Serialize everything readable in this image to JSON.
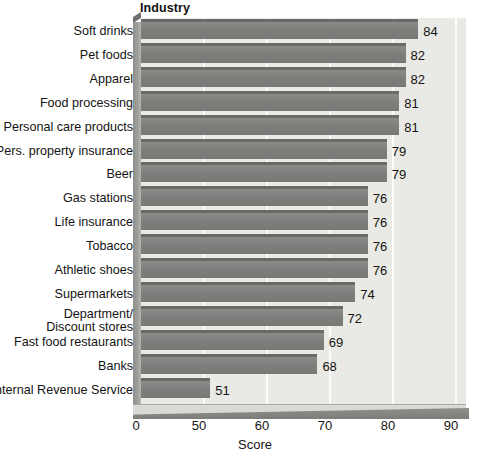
{
  "chart_data": {
    "type": "bar",
    "orientation": "horizontal",
    "title": "Industry",
    "xlabel": "Score",
    "ylabel": "",
    "grid": true,
    "legend": "none",
    "xlim": [
      0,
      90
    ],
    "xticks": [
      0,
      50,
      60,
      70,
      80,
      90
    ],
    "xtick_labels": [
      "0",
      "50",
      "60",
      "70",
      "80",
      "90"
    ],
    "axis_note": "broken axis: 0 to 50 compressed into one interval",
    "categories": [
      "Soft drinks",
      "Pet foods",
      "Apparel",
      "Food processing",
      "Personal care products",
      "Pers. property insurance",
      "Beer",
      "Gas stations",
      "Life insurance",
      "Tobacco",
      "Athletic shoes",
      "Supermarkets",
      "Department/ Discount stores",
      "Fast food restaurants",
      "Banks",
      "Internal Revenue Service"
    ],
    "category_lines": [
      [
        "Soft drinks"
      ],
      [
        "Pet foods"
      ],
      [
        "Apparel"
      ],
      [
        "Food processing"
      ],
      [
        "Personal care products"
      ],
      [
        "Pers. property insurance"
      ],
      [
        "Beer"
      ],
      [
        "Gas stations"
      ],
      [
        "Life insurance"
      ],
      [
        "Tobacco"
      ],
      [
        "Athletic shoes"
      ],
      [
        "Supermarkets"
      ],
      [
        "Department/",
        "Discount stores"
      ],
      [
        "Fast food restaurants"
      ],
      [
        "Banks"
      ],
      [
        "Internal Revenue Service"
      ]
    ],
    "values": [
      84,
      82,
      82,
      81,
      81,
      79,
      79,
      76,
      76,
      76,
      76,
      74,
      72,
      69,
      68,
      51
    ],
    "value_labels": [
      "84",
      "82",
      "82",
      "81",
      "81",
      "79",
      "79",
      "76",
      "76",
      "76",
      "76",
      "74",
      "72",
      "69",
      "68",
      "51"
    ],
    "colors": {
      "bar": "#807f7d",
      "bar_top": "#6a6a68",
      "plot_background": "#e9e9e6",
      "gridline": "#fbfbfa",
      "wall": "#9d9d9a",
      "floor": "#d9d9d6",
      "text": "#141414",
      "page_background": "#ffffff"
    }
  }
}
